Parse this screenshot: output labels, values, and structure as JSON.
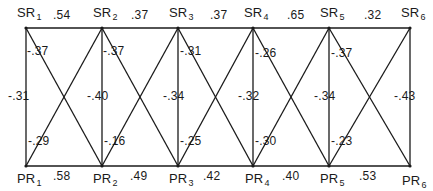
{
  "diagram": {
    "type": "network-correlation-lattice",
    "line_color": "#1a1a1a",
    "top_nodes": [
      {
        "prefix": "SR",
        "sub": "1",
        "x": 26
      },
      {
        "prefix": "SR",
        "sub": "2",
        "x": 102
      },
      {
        "prefix": "SR",
        "sub": "3",
        "x": 178
      },
      {
        "prefix": "SR",
        "sub": "4",
        "x": 253
      },
      {
        "prefix": "SR",
        "sub": "5",
        "x": 329
      },
      {
        "prefix": "SR",
        "sub": "6",
        "x": 410
      }
    ],
    "bottom_nodes": [
      {
        "prefix": "PR",
        "sub": "1",
        "x": 26
      },
      {
        "prefix": "PR",
        "sub": "2",
        "x": 102
      },
      {
        "prefix": "PR",
        "sub": "3",
        "x": 178
      },
      {
        "prefix": "PR",
        "sub": "4",
        "x": 253
      },
      {
        "prefix": "PR",
        "sub": "5",
        "x": 329
      },
      {
        "prefix": "PR",
        "sub": "6",
        "x": 410
      }
    ],
    "top_y": 28,
    "bottom_y": 166,
    "top_edge_weights": [
      ".54",
      ".37",
      ".37",
      ".65",
      ".32"
    ],
    "bottom_edge_weights": [
      ".58",
      ".49",
      ".42",
      ".40",
      ".53"
    ],
    "vertical_weights": [
      "-.31",
      "-.40",
      "-.34",
      "-.32",
      "-.34",
      "-.43"
    ],
    "diagonal_down_weights": [
      "-.37",
      "-.37",
      "-.31",
      "-.26",
      "-.37"
    ],
    "diagonal_up_weights": [
      "-.29",
      "-.16",
      "-.25",
      "-.30",
      "-.23"
    ]
  }
}
